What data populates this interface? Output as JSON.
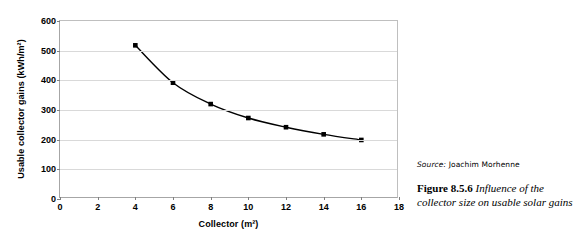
{
  "chart_data": {
    "type": "line",
    "title": "",
    "xlabel": "Collector (m²)",
    "ylabel": "Usable collector gains (kWh/m²)",
    "x": [
      4,
      6,
      8,
      10,
      12,
      14,
      16
    ],
    "values": [
      518,
      392,
      320,
      273,
      242,
      218,
      199
    ],
    "series": [
      {
        "name": "Usable collector gains",
        "x": [
          4,
          6,
          8,
          10,
          12,
          14,
          16
        ],
        "values": [
          518,
          392,
          320,
          273,
          242,
          218,
          199
        ],
        "marker": "square",
        "marker_color": "#000000",
        "line_color": "#000000"
      }
    ],
    "xlim": [
      0,
      18
    ],
    "ylim": [
      0,
      600
    ],
    "xticks": [
      0,
      2,
      4,
      6,
      8,
      10,
      12,
      14,
      16,
      18
    ],
    "yticks": [
      0,
      100,
      200,
      300,
      400,
      500,
      600
    ],
    "xtick_labels": [
      "0",
      "2",
      "4",
      "6",
      "8",
      "10",
      "12",
      "14",
      "16",
      "18"
    ],
    "ytick_labels": [
      "0",
      "100",
      "200",
      "300",
      "400",
      "500",
      "600"
    ],
    "grid": "horizontal",
    "legend": "none",
    "gridline_color": "#d9d9d9",
    "frame_color": "#a6a6a6"
  },
  "caption": {
    "source_label": "Source:",
    "source_name": "Joachim Morhenne",
    "figure_number": "Figure 8.5.6",
    "figure_text": "Influence of the collector size on usable solar gains"
  }
}
